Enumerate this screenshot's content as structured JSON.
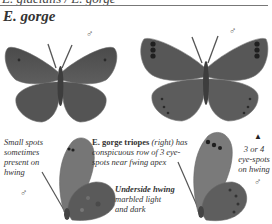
{
  "header": {
    "cut_off_title": "E. glacialis / E. gorge",
    "species_heading": "E. gorge"
  },
  "figures": [
    {
      "id": "male-upperside-left",
      "sex_symbol": "♂",
      "view": "upperside"
    },
    {
      "id": "male-upperside-right",
      "sex_symbol": "♂",
      "view": "upperside",
      "subspecies": "E. gorge triopes"
    },
    {
      "id": "male-underside-left",
      "sex_symbol": "♂",
      "view": "underside"
    },
    {
      "id": "male-underside-right",
      "sex_symbol": "♂",
      "view": "underside"
    }
  ],
  "annotations": {
    "small_spots": "Small spots sometimes present on hwing",
    "triopes_name": "E. gorge triopes",
    "triopes_paren": "(right)",
    "triopes_text": "has conspicuous row of 3 eye-spots near fwing apex",
    "underside_bold": "Underside hwing",
    "underside_text": "marbled light and dark",
    "eyespots": "3 or 4 eye-spots on hwing",
    "marker": "▲"
  },
  "colors": {
    "wing_dark": "#4a4a4a",
    "wing_mid": "#6e6e6e",
    "wing_light": "#9a9a9a",
    "rule": "#777777"
  }
}
